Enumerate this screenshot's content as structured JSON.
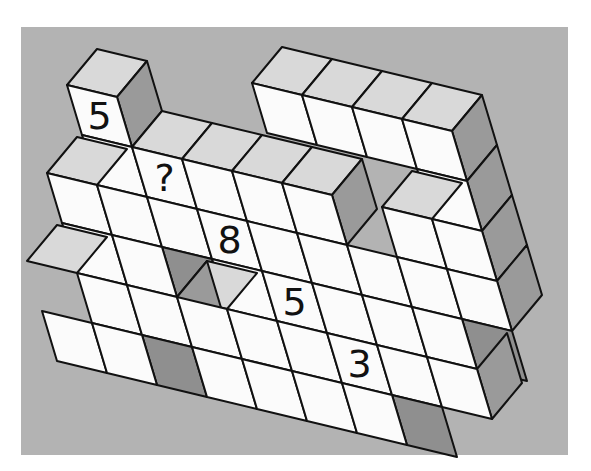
{
  "puzzle": {
    "title": "",
    "question_mark": "?",
    "numbered_faces": [
      {
        "label": "5",
        "c": -2,
        "r": -2
      },
      {
        "label": "?",
        "c": -1,
        "r": -1
      },
      {
        "label": "8",
        "c": 0,
        "r": 0
      },
      {
        "label": "5",
        "c": 1,
        "r": 1
      },
      {
        "label": "3",
        "c": 2,
        "r": 2
      }
    ],
    "colors": {
      "background": "#b3b3b3",
      "front_face": "#fbfbfb",
      "top_face": "#d9d9d9",
      "side_face": "#9a9a9a",
      "edge": "#111111"
    },
    "projection": {
      "origin": [
        197,
        209
      ],
      "u": [
        50,
        12
      ],
      "v": [
        15,
        50
      ],
      "d": [
        30,
        -36
      ]
    },
    "faces": [
      {
        "type": "top",
        "c": 2,
        "r": -3
      },
      {
        "type": "top",
        "c": 3,
        "r": -3
      },
      {
        "type": "top",
        "c": 4,
        "r": -3
      },
      {
        "type": "top",
        "c": 5,
        "r": -3
      },
      {
        "type": "front",
        "c": 2,
        "r": -3
      },
      {
        "type": "front",
        "c": 3,
        "r": -3
      },
      {
        "type": "front",
        "c": 4,
        "r": -3
      },
      {
        "type": "front",
        "c": 5,
        "r": -3
      },
      {
        "type": "right",
        "c": 5,
        "r": -3
      },
      {
        "type": "front",
        "c": 5,
        "r": -2
      },
      {
        "type": "right",
        "c": 5,
        "r": -2
      },
      {
        "type": "front",
        "c": 5,
        "r": -1
      },
      {
        "type": "right",
        "c": 5,
        "r": -1
      },
      {
        "type": "top",
        "c": -2,
        "r": -2
      },
      {
        "type": "front",
        "c": -2,
        "r": -2
      },
      {
        "type": "right",
        "c": -2,
        "r": -2
      },
      {
        "type": "top",
        "c": -1,
        "r": -1
      },
      {
        "type": "top",
        "c": 0,
        "r": -1
      },
      {
        "type": "top",
        "c": 1,
        "r": -1
      },
      {
        "type": "top",
        "c": 2,
        "r": -1
      },
      {
        "type": "front",
        "c": -2,
        "r": -1
      },
      {
        "type": "front",
        "c": -1,
        "r": -1
      },
      {
        "type": "front",
        "c": 0,
        "r": -1
      },
      {
        "type": "front",
        "c": 1,
        "r": -1
      },
      {
        "type": "front",
        "c": 2,
        "r": -1
      },
      {
        "type": "right",
        "c": 2,
        "r": -1
      },
      {
        "type": "top",
        "c": -3,
        "r": 0
      },
      {
        "type": "front",
        "c": -3,
        "r": 0
      },
      {
        "type": "front",
        "c": -2,
        "r": 0
      },
      {
        "type": "front",
        "c": -1,
        "r": 0
      },
      {
        "type": "front",
        "c": 0,
        "r": 0
      },
      {
        "type": "front",
        "c": 1,
        "r": 0
      },
      {
        "type": "front",
        "c": 2,
        "r": 0
      },
      {
        "type": "top",
        "c": 4,
        "r": -1
      },
      {
        "type": "front",
        "c": 4,
        "r": -1
      },
      {
        "type": "front",
        "c": 3,
        "r": 0
      },
      {
        "type": "front",
        "c": 4,
        "r": 0
      },
      {
        "type": "front",
        "c": 5,
        "r": 0
      },
      {
        "type": "right",
        "c": 5,
        "r": 0
      },
      {
        "type": "front",
        "c": -3,
        "r": 1
      },
      {
        "type": "front",
        "c": -2,
        "r": 1
      },
      {
        "type": "shadow",
        "c": -1,
        "r": 1
      },
      {
        "type": "front",
        "c": 0,
        "r": 1
      },
      {
        "type": "front",
        "c": 1,
        "r": 1
      },
      {
        "type": "front",
        "c": 2,
        "r": 1
      },
      {
        "type": "front",
        "c": 3,
        "r": 1
      },
      {
        "type": "front",
        "c": 4,
        "r": 1
      },
      {
        "type": "shadow",
        "c": 5,
        "r": 1
      },
      {
        "type": "top",
        "c": -4,
        "r": 2
      },
      {
        "type": "front",
        "c": -3,
        "r": 2
      },
      {
        "type": "front",
        "c": -2,
        "r": 2
      },
      {
        "type": "right",
        "c": -2,
        "r": 2
      },
      {
        "type": "top",
        "c": -1,
        "r": 2
      },
      {
        "type": "front",
        "c": -1,
        "r": 2
      },
      {
        "type": "front",
        "c": 0,
        "r": 2
      },
      {
        "type": "front",
        "c": 1,
        "r": 2
      },
      {
        "type": "front",
        "c": 2,
        "r": 2
      },
      {
        "type": "front",
        "c": 3,
        "r": 2
      },
      {
        "type": "front",
        "c": 4,
        "r": 2
      },
      {
        "type": "right",
        "c": 4,
        "r": 2
      },
      {
        "type": "front",
        "c": -4,
        "r": 3
      },
      {
        "type": "front",
        "c": -3,
        "r": 3
      },
      {
        "type": "shadow",
        "c": -2,
        "r": 3
      },
      {
        "type": "front",
        "c": -1,
        "r": 3
      },
      {
        "type": "front",
        "c": 0,
        "r": 3
      },
      {
        "type": "front",
        "c": 1,
        "r": 3
      },
      {
        "type": "front",
        "c": 2,
        "r": 3
      },
      {
        "type": "shadow",
        "c": 3,
        "r": 3
      }
    ]
  }
}
